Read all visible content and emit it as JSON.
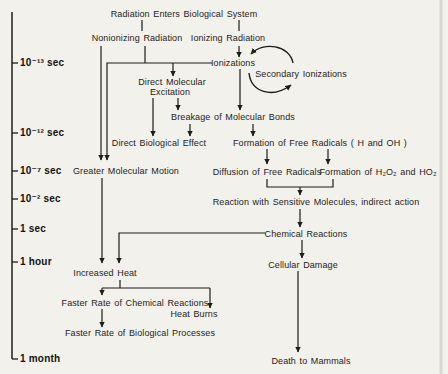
{
  "figure_type": "radiation-effects-timeline-flowchart",
  "colors": {
    "paper": "#f3f1ec",
    "ink": "#1e1c1a"
  },
  "timeline": {
    "labels": [
      "10⁻¹³ sec",
      "10⁻¹² sec",
      "10⁻⁷ sec",
      "10⁻² sec",
      "1 sec",
      "1 hour",
      "1 month"
    ]
  },
  "nodes": {
    "radiation_enters": "Radiation Enters Biological System",
    "nonionizing_radiation": "Nonionizing Radiation",
    "ionizing_radiation": "Ionizing Radiation",
    "ionizations": "Ionizations",
    "secondary_ionizations": "Secondary Ionizations",
    "direct_molecular_excitation_line1": "Direct Molecular",
    "direct_molecular_excitation_line2": "Excitation",
    "breakage_molecular_bonds": "Breakage of Molecular Bonds",
    "direct_biological_effect": "Direct Biological Effect",
    "formation_free_radicals": "Formation of Free Radicals ( H and OH )",
    "greater_molecular_motion": "Greater Molecular Motion",
    "diffusion_free_radicals": "Diffusion of Free Radicals",
    "formation_peroxides": "Formation of H₂O₂ and HO₂",
    "reaction_sensitive_molecules": "Reaction with Sensitive Molecules, indirect action",
    "chemical_reactions": "Chemical Reactions",
    "cellular_damage": "Cellular Damage",
    "increased_heat": "Increased Heat",
    "faster_chemical_reactions": "Faster Rate of Chemical Reactions",
    "heat_burns": "Heat Burns",
    "faster_biological_processes": "Faster Rate of Biological Processes",
    "death_to_mammals": "Death to Mammals"
  }
}
